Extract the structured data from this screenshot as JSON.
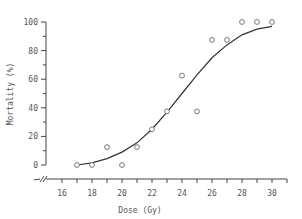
{
  "chart_data": {
    "type": "scatter",
    "title": "",
    "xlabel": "Dose (Gy)",
    "ylabel": "Mortality (%)",
    "xlim": [
      15,
      31
    ],
    "ylim": [
      0,
      100
    ],
    "x_ticks": [
      16,
      18,
      20,
      22,
      24,
      26,
      28,
      30
    ],
    "y_ticks": [
      0,
      20,
      40,
      60,
      80,
      100
    ],
    "grid": false,
    "axis_break": true,
    "series": [
      {
        "name": "observed",
        "marker": "open-circle",
        "x": [
          17,
          18,
          19,
          20,
          21,
          22,
          23,
          24,
          25,
          26,
          27,
          28,
          29,
          30
        ],
        "y": [
          0,
          0,
          12.5,
          0,
          12.5,
          25,
          37.5,
          62.5,
          37.5,
          87.5,
          87.5,
          100,
          100,
          100
        ]
      },
      {
        "name": "fitted-sigmoid",
        "type": "line",
        "x": [
          17,
          18,
          19,
          20,
          21,
          22,
          23,
          24,
          25,
          26,
          27,
          28,
          29,
          30
        ],
        "y": [
          0,
          1.5,
          4.5,
          9,
          15.5,
          25,
          37,
          50,
          63,
          75,
          84,
          91,
          95,
          97
        ]
      }
    ]
  }
}
